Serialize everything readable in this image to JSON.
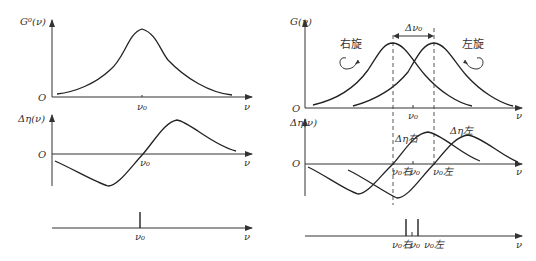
{
  "left": {
    "top_plot": {
      "y_label": "G⁰(ν)",
      "origin_label": "O",
      "x_label": "ν",
      "tick_label": "ν₀"
    },
    "middle_plot": {
      "y_label": "Δη(ν)",
      "origin_label": "O",
      "x_label": "ν",
      "tick_label": "ν₀"
    },
    "bottom_plot": {
      "x_label": "ν",
      "tick_label": "ν₀"
    }
  },
  "right": {
    "top_plot": {
      "y_label": "G(ν)",
      "origin_label": "O",
      "x_label": "ν",
      "tick_label": "ν₀",
      "delta_label": "Δν₀",
      "right_rot_label": "右旋",
      "left_rot_label": "左旋"
    },
    "middle_plot": {
      "y_label": "Δη(ν)",
      "origin_label": "O",
      "x_label": "ν",
      "curve_right_label": "Δη右",
      "curve_left_label": "Δη左",
      "tick_right": "ν₀右",
      "tick_center": "ν₀",
      "tick_left": "ν₀左"
    },
    "bottom_plot": {
      "x_label": "ν",
      "tick_right": "ν₀右",
      "tick_center": "ν₀",
      "tick_left": "ν₀左"
    }
  }
}
